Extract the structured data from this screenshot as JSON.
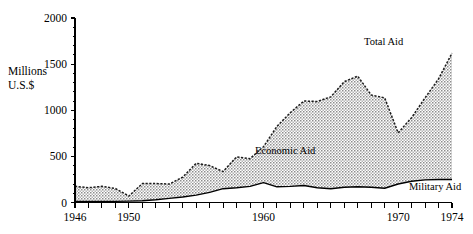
{
  "chart_data": {
    "type": "area",
    "title": "",
    "subtitle": "",
    "xlabel": "",
    "ylabel": "Millions U.S.$",
    "ylabel_line1": "Millions",
    "ylabel_line2": "U.S.$",
    "xlim": [
      1946,
      1974
    ],
    "ylim": [
      0,
      2000
    ],
    "grid": false,
    "stacked": true,
    "legend_position": "inline-annotations",
    "y_ticks_major": [
      0,
      500,
      1000,
      1500,
      2000
    ],
    "y_ticks_major_labels": [
      "0",
      "500",
      "1000",
      "1500",
      "2000"
    ],
    "y_tick_minor_step": 100,
    "x_ticks": [
      1946,
      1947,
      1948,
      1949,
      1950,
      1951,
      1952,
      1953,
      1954,
      1955,
      1956,
      1957,
      1958,
      1959,
      1960,
      1961,
      1962,
      1963,
      1964,
      1965,
      1966,
      1967,
      1968,
      1969,
      1970,
      1971,
      1972,
      1973,
      1974
    ],
    "x_tick_labels": [
      {
        "year": 1946,
        "label": "1946"
      },
      {
        "year": 1950,
        "label": "1950"
      },
      {
        "year": 1960,
        "label": "1960"
      },
      {
        "year": 1970,
        "label": "1970"
      },
      {
        "year": 1974,
        "label": "1974"
      }
    ],
    "x": [
      1946,
      1947,
      1948,
      1949,
      1950,
      1951,
      1952,
      1953,
      1954,
      1955,
      1956,
      1957,
      1958,
      1959,
      1960,
      1961,
      1962,
      1963,
      1964,
      1965,
      1966,
      1967,
      1968,
      1969,
      1970,
      1971,
      1972,
      1973,
      1974
    ],
    "series": [
      {
        "name": "Military Aid",
        "label": "Military Aid",
        "fill": "#ffffff",
        "values": [
          10,
          10,
          10,
          12,
          15,
          20,
          30,
          45,
          60,
          80,
          110,
          150,
          160,
          175,
          215,
          170,
          175,
          185,
          160,
          150,
          165,
          170,
          165,
          155,
          200,
          230,
          245,
          250,
          250
        ]
      },
      {
        "name": "Economic Aid",
        "label": "Economic Aid",
        "fill": "#a8a8a8",
        "values": [
          165,
          150,
          165,
          140,
          55,
          185,
          175,
          155,
          215,
          345,
          290,
          185,
          335,
          300,
          390,
          655,
          800,
          915,
          935,
          995,
          1145,
          1200,
          1000,
          980,
          555,
          690,
          890,
          1090,
          1370
        ]
      }
    ],
    "total_series": {
      "name": "Total Aid",
      "label": "Total Aid",
      "values": [
        175,
        160,
        175,
        152,
        70,
        205,
        205,
        200,
        275,
        425,
        400,
        335,
        495,
        475,
        605,
        825,
        975,
        1100,
        1095,
        1145,
        1310,
        1370,
        1165,
        1135,
        755,
        920,
        1135,
        1340,
        1620
      ]
    },
    "annotations": [
      {
        "name": "total-aid-label",
        "text": "Total Aid"
      },
      {
        "name": "economic-aid-label",
        "text": "Economic Aid"
      },
      {
        "name": "military-aid-label",
        "text": "Military Aid"
      }
    ]
  }
}
